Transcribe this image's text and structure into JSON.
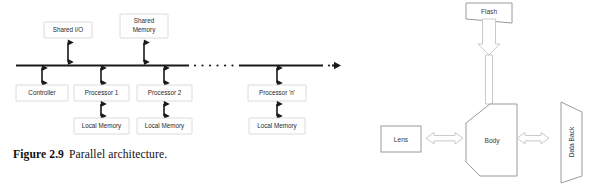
{
  "figure": {
    "caption_label": "Figure 2.9",
    "caption_text": "Parallel architecture.",
    "ink_color": "#1a1a1a",
    "box_border_color": "#d3d3d3"
  },
  "parallel_architecture": {
    "bus_label": "system bus",
    "top_boxes": [
      {
        "id": "shared-io",
        "label": "Shared I/O",
        "label_line1": "Shared I/O",
        "label_line2": ""
      },
      {
        "id": "shared-memory",
        "label": "Shared Memory",
        "label_line1": "Shared",
        "label_line2": "Memory"
      }
    ],
    "node_boxes": [
      {
        "id": "controller",
        "label": "Controller",
        "has_local_memory": false
      },
      {
        "id": "processor-1",
        "label": "Processor 1",
        "has_local_memory": true
      },
      {
        "id": "processor-2",
        "label": "Processor 2",
        "has_local_memory": true
      },
      {
        "id": "processor-n",
        "label": "Processor 'n'",
        "has_local_memory": true
      }
    ],
    "local_memory_label": "Local Memory",
    "continuation": ". . . . . . ."
  },
  "camera_system": {
    "components": [
      {
        "id": "flash",
        "label": "Flash",
        "shape": "skewed-rect"
      },
      {
        "id": "body",
        "label": "Body",
        "shape": "camera-body-polygon"
      },
      {
        "id": "lens",
        "label": "Lens",
        "shape": "rect"
      },
      {
        "id": "data-back",
        "label": "Data Back",
        "shape": "trapezoid",
        "rotated": true
      }
    ],
    "connectors": [
      {
        "id": "flash-body",
        "from": "flash",
        "to": "body",
        "style": "block-arrow",
        "direction": "down"
      },
      {
        "id": "lens-body",
        "from": "lens",
        "to": "body",
        "style": "block-arrow",
        "direction": "bidirectional"
      },
      {
        "id": "body-databack",
        "from": "body",
        "to": "data-back",
        "style": "block-arrow",
        "direction": "bidirectional"
      }
    ],
    "outline_color": "#9a9a9a",
    "arrow_color": "#c9c9c9"
  }
}
